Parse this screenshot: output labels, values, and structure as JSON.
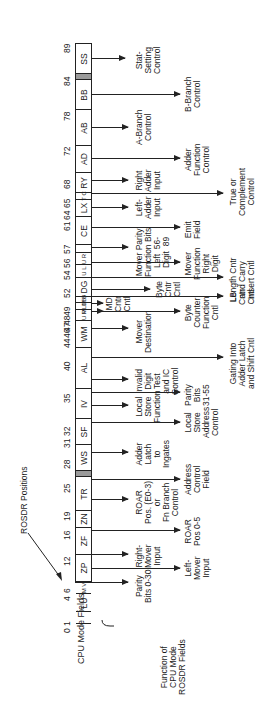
{
  "diagram": {
    "title_positions": "ROSDR Positions",
    "axis_label": "CPU Mode Fields",
    "brace_label": "Function of\nCPU Mode\nROSDR Fields",
    "positions": [
      {
        "n": "0 1",
        "y": 585
      },
      {
        "n": "4",
        "y": 553
      },
      {
        "n": "6",
        "y": 545
      },
      {
        "n": "12",
        "y": 518
      },
      {
        "n": "16",
        "y": 492
      },
      {
        "n": "19",
        "y": 473
      },
      {
        "n": "25",
        "y": 445
      },
      {
        "n": "28",
        "y": 421
      },
      {
        "n": "31",
        "y": 400
      },
      {
        "n": "32",
        "y": 388
      },
      {
        "n": "35",
        "y": 355
      },
      {
        "n": "40",
        "y": 323
      },
      {
        "n": "44",
        "y": 300
      },
      {
        "n": "46",
        "y": 290
      },
      {
        "n": "47",
        "y": 284
      },
      {
        "n": "48",
        "y": 277
      },
      {
        "n": "49",
        "y": 268
      },
      {
        "n": "52",
        "y": 250
      },
      {
        "n": "54",
        "y": 232
      },
      {
        "n": "56",
        "y": 220
      },
      {
        "n": "57",
        "y": 206
      },
      {
        "n": "61",
        "y": 183
      },
      {
        "n": "64",
        "y": 172
      },
      {
        "n": "65",
        "y": 160
      },
      {
        "n": "68",
        "y": 141
      },
      {
        "n": "72",
        "y": 108
      },
      {
        "n": "78",
        "y": 73
      },
      {
        "n": "84",
        "y": 38
      },
      {
        "n": "89",
        "y": 5
      }
    ],
    "fields": [
      {
        "label": "SS",
        "top": 0,
        "h": 30,
        "shaded": false
      },
      {
        "label": "",
        "top": 30,
        "h": 6,
        "shaded": true
      },
      {
        "label": "BB",
        "top": 36,
        "h": 30,
        "shaded": false
      },
      {
        "label": "AB",
        "top": 66,
        "h": 36,
        "shaded": false
      },
      {
        "label": "AD",
        "top": 102,
        "h": 27,
        "shaded": false
      },
      {
        "label": "RY",
        "top": 129,
        "h": 20,
        "shaded": false
      },
      {
        "label": "T C",
        "top": 149,
        "h": 7,
        "shaded": false,
        "small": true
      },
      {
        "label": "LX",
        "top": 156,
        "h": 17,
        "shaded": false
      },
      {
        "label": "CE",
        "top": 173,
        "h": 28,
        "shaded": false
      },
      {
        "label": "",
        "top": 201,
        "h": 8,
        "shaded": false
      },
      {
        "label": "U R",
        "top": 209,
        "h": 12,
        "shaded": false,
        "small": true
      },
      {
        "label": "U L",
        "top": 221,
        "h": 13,
        "shaded": false,
        "small": true
      },
      {
        "label": "DG",
        "top": 234,
        "h": 19,
        "shaded": false
      },
      {
        "label": "M B",
        "top": 253,
        "h": 6,
        "shaded": false,
        "small": true
      },
      {
        "label": "MLDB",
        "top": 259,
        "h": 7,
        "shaded": false,
        "small": true
      },
      {
        "label": "U P",
        "top": 266,
        "h": 11,
        "shaded": false,
        "small": true
      },
      {
        "label": "WM",
        "top": 277,
        "h": 27,
        "shaded": false
      },
      {
        "label": "AL",
        "top": 304,
        "h": 41,
        "shaded": false
      },
      {
        "label": "IV",
        "top": 345,
        "h": 30,
        "shaded": false
      },
      {
        "label": "SF",
        "top": 375,
        "h": 26,
        "shaded": false
      },
      {
        "label": "WS",
        "top": 401,
        "h": 26,
        "shaded": false
      },
      {
        "label": "",
        "top": 427,
        "h": 6,
        "shaded": true
      },
      {
        "label": "TR",
        "top": 433,
        "h": 34,
        "shaded": false
      },
      {
        "label": "ZN",
        "top": 467,
        "h": 17,
        "shaded": false
      },
      {
        "label": "ZF",
        "top": 484,
        "h": 27,
        "shaded": false
      },
      {
        "label": "ZP",
        "top": 511,
        "h": 27,
        "shaded": false
      },
      {
        "label": "M V",
        "top": 538,
        "h": 12,
        "shaded": false,
        "small": true
      },
      {
        "label": "LU",
        "top": 550,
        "h": 18,
        "shaded": false
      },
      {
        "label": "",
        "top": 568,
        "h": 12,
        "shaded": false
      }
    ],
    "functions": [
      {
        "text": "Stat-\nSetting\nControl",
        "y": 58,
        "ax_end": 125,
        "tx": 135
      },
      {
        "text": "B-Branch\nControl",
        "y": 94,
        "ax_end": 180,
        "tx": 184
      },
      {
        "text": "A-Branch\nControl",
        "y": 127,
        "ax_end": 128,
        "tx": 135
      },
      {
        "text": "Adder\nFunction\nControl",
        "y": 158,
        "ax_end": 180,
        "tx": 184
      },
      {
        "text": "Right\nAdder\nInput",
        "y": 180,
        "ax_end": 128,
        "tx": 135
      },
      {
        "text": "True or\nComplement\nControl",
        "y": 193,
        "ax_end": 223,
        "tx": 229
      },
      {
        "text": "Left-\nAdder\nInput",
        "y": 207,
        "ax_end": 128,
        "tx": 135
      },
      {
        "text": "Emit\nField",
        "y": 227,
        "ax_end": 180,
        "tx": 184
      },
      {
        "text": "Mover Parity\nFunction Bits\nLeft  56-\nDigit  89",
        "y": 247,
        "ax_end": 128,
        "tx": 135
      },
      {
        "text": "Mover\nFunction\nRight\nDigit",
        "y": 262,
        "ax_end": 180,
        "tx": 184
      },
      {
        "text": "Length Cntr\nand Carry\nInsert Cntl",
        "y": 277,
        "ax_end": 223,
        "tx": 229
      },
      {
        "text": "Byte\nCntr\nCntl",
        "y": 289,
        "ax_end": 150,
        "tx": 155
      },
      {
        "text": "LB\nCntr\nCntl",
        "y": 296,
        "ax_end": 223,
        "tx": 229
      },
      {
        "text": "MD\nCntr\nCntl",
        "y": 303,
        "ax_end": 103,
        "tx": 105
      },
      {
        "text": "M Byte\nCntr\nCntl",
        "y": 311,
        "ax_end": 103,
        "tx": 0
      },
      {
        "text": "Byte\nCounter\nFunction\nCntl",
        "y": 311,
        "ax_end": 180,
        "tx": 184
      },
      {
        "text": "Mover\nDestination",
        "y": 328,
        "ax_end": 128,
        "tx": 135
      },
      {
        "text": "Gating Into\nAdder Latch\nand Shift Cntl",
        "y": 357,
        "ax_end": 223,
        "tx": 229
      },
      {
        "text": "Invalid\nDigit\nTest\nand IC\nControl",
        "y": 379,
        "ax_end": 128,
        "tx": 135
      },
      {
        "text": "Parity\nBits\n31-55",
        "y": 392,
        "ax_end": 180,
        "tx": 184
      },
      {
        "text": "Local\nStore\nFunction",
        "y": 405,
        "ax_end": 128,
        "tx": 135
      },
      {
        "text": "Local\nStore\nAddress\nControl",
        "y": 422,
        "ax_end": 180,
        "tx": 184
      },
      {
        "text": "Adder\nLatch\nto\nIngates",
        "y": 452,
        "ax_end": 128,
        "tx": 135
      },
      {
        "text": "Address\nControl\nField",
        "y": 479,
        "ax_end": 180,
        "tx": 184
      },
      {
        "text": "ROAR\nPos. (E0-3)\nor\nFn Branch\nControl",
        "y": 499,
        "ax_end": 128,
        "tx": 135
      },
      {
        "text": "ROAR\nPos 0-5",
        "y": 530,
        "ax_end": 180,
        "tx": 184
      },
      {
        "text": "Right-\nMover\nInput",
        "y": 554,
        "ax_end": 128,
        "tx": 135
      },
      {
        "text": "Left-\nMover\nInput",
        "y": 568,
        "ax_end": 180,
        "tx": 184
      },
      {
        "text": "Parity\nBits 0-30",
        "y": 582,
        "ax_end": 128,
        "tx": 135
      }
    ]
  }
}
